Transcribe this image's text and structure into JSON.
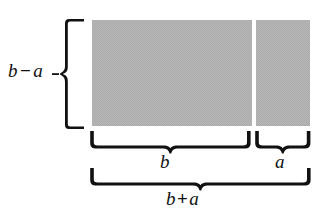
{
  "figure": {
    "background_color": "#ffffff",
    "ink_color": "#111111",
    "fill_color": "#a9a9a9",
    "width": 325,
    "height": 216
  },
  "labels": {
    "height_label": {
      "left_term": "b",
      "operator": "−",
      "right_term": "a",
      "full": "b − a",
      "position": "left"
    },
    "segment_b": {
      "text": "b",
      "position": "bottom-left-segment"
    },
    "segment_a": {
      "text": "a",
      "position": "bottom-right-segment"
    },
    "total_width": {
      "left_term": "b",
      "operator": "+",
      "right_term": "a",
      "full": "b + a",
      "position": "bottom-total"
    }
  },
  "braces": {
    "vertical_left": {
      "measures": "b − a",
      "orientation": "vertical",
      "direction": "points-left"
    },
    "horizontal_b": {
      "measures": "b",
      "orientation": "horizontal",
      "direction": "points-down"
    },
    "horizontal_a": {
      "measures": "a",
      "orientation": "horizontal",
      "direction": "points-down"
    },
    "horizontal_total": {
      "measures": "b + a",
      "orientation": "horizontal",
      "direction": "points-down"
    }
  },
  "rectangles": [
    {
      "name": "rect-b",
      "width_label": "b",
      "height_label": "b − a",
      "fill": "#a9a9a9"
    },
    {
      "name": "rect-a",
      "width_label": "a",
      "height_label": "b − a",
      "fill": "#a9a9a9"
    }
  ]
}
